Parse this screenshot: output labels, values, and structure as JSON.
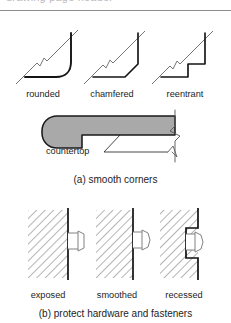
{
  "figure": {
    "top_cut_text": "drawing page header",
    "corner_profiles": {
      "items": [
        {
          "label": "rounded",
          "type": "rounded-corner-profile"
        },
        {
          "label": "chamfered",
          "type": "chamfered-corner-profile"
        },
        {
          "label": "reentrant",
          "type": "reentrant-corner-profile"
        }
      ]
    },
    "countertop": {
      "label": "countertop",
      "fill_color": "#a9a9a9",
      "outline_color": "#1a1a1a"
    },
    "caption_a": "(a) smooth corners",
    "hardware": {
      "items": [
        {
          "label": "exposed",
          "type": "exposed-fastener-detail"
        },
        {
          "label": "smoothed",
          "type": "smoothed-fastener-detail"
        },
        {
          "label": "recessed",
          "type": "recessed-fastener-detail"
        }
      ],
      "hatch_color": "#6e6e6e",
      "wall_color": "#111111"
    },
    "caption_b": "(b) protect hardware and fasteners"
  }
}
